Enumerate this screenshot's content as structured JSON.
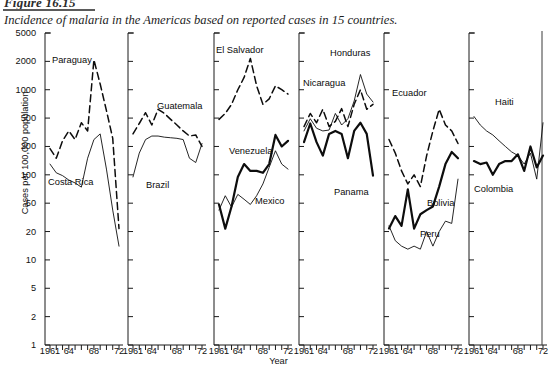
{
  "figure": {
    "number": "Figure 16.15",
    "caption": "Incidence of malaria in the Americas based on reported cases in 15 countries."
  },
  "axes": {
    "ylabel": "Cases per 100,000 population",
    "xlabel": "Year",
    "yticks": [
      "1",
      "2",
      "5",
      "10",
      "20",
      "50",
      "100",
      "200",
      "500",
      "1000",
      "2000",
      "5000"
    ],
    "xticks": [
      "1961",
      "64",
      "68",
      "72"
    ]
  },
  "labels": {
    "paraguay": "Paraguay",
    "costa_rica": "Costa Rica",
    "guatemala": "Guatemala",
    "brazil": "Brazil",
    "el_salvador": "El Salvador",
    "venezuela": "Venezuela",
    "mexico": "Mexico",
    "honduras": "Honduras",
    "nicaragua": "Nicaragua",
    "panama": "Panama",
    "ecuador": "Ecuador",
    "bolivia": "Bolivia",
    "peru": "Peru",
    "haiti": "Haiti",
    "colombia": "Colombia"
  },
  "chart_data": {
    "type": "line",
    "title": "Incidence of malaria in the Americas based on reported cases in 15 countries.",
    "xlabel": "Year",
    "ylabel": "Cases per 100,000 population",
    "yscale": "log",
    "ylim": [
      1,
      5000
    ],
    "ytick_values": [
      1,
      2,
      5,
      10,
      20,
      50,
      100,
      200,
      500,
      1000,
      2000,
      5000
    ],
    "x": [
      1961,
      1962,
      1963,
      1964,
      1965,
      1966,
      1967,
      1968,
      1969,
      1970,
      1971,
      1972
    ],
    "xlim": [
      1961,
      1972
    ],
    "grid": false,
    "legend": "inline-annotations",
    "panels": [
      {
        "panel": 1,
        "series": [
          {
            "name": "Paraguay",
            "style": "dashed",
            "width": "medium",
            "values": [
              190,
              150,
              240,
              330,
              250,
              430,
              330,
              2100,
              1150,
              600,
              260,
              22
            ]
          },
          {
            "name": "Costa Rica",
            "style": "solid",
            "width": "thin",
            "values": [
              130,
              105,
              98,
              88,
              82,
              74,
              150,
              250,
              300,
              115,
              40,
              14
            ]
          }
        ]
      },
      {
        "panel": 2,
        "series": [
          {
            "name": "Guatemala",
            "style": "dashed",
            "width": "medium",
            "values": [
              300,
              420,
              570,
              400,
              620,
              560,
              480,
              400,
              330,
              280,
              290,
              200
            ]
          },
          {
            "name": "Brazil",
            "style": "solid",
            "width": "thin",
            "values": [
              95,
              170,
              250,
              280,
              280,
              270,
              265,
              260,
              250,
              150,
              135,
              220
            ]
          }
        ]
      },
      {
        "panel": 3,
        "series": [
          {
            "name": "El Salvador",
            "style": "dashed",
            "width": "medium",
            "values": [
              480,
              560,
              700,
              1000,
              1350,
              2200,
              1100,
              700,
              800,
              1100,
              1000,
              900
            ]
          },
          {
            "name": "Venezuela",
            "style": "solid",
            "width": "thick",
            "values": [
              48,
              22,
              45,
              95,
              130,
              110,
              110,
              105,
              130,
              290,
              200,
              240
            ]
          },
          {
            "name": "Mexico",
            "style": "solid",
            "width": "thin",
            "values": [
              40,
              60,
              44,
              62,
              55,
              48,
              60,
              80,
              120,
              180,
              130,
              115
            ]
          }
        ]
      },
      {
        "panel": 4,
        "series": [
          {
            "name": "Honduras",
            "style": "solid",
            "width": "thin",
            "values": [
              330,
              490,
              360,
              330,
              340,
              560,
              400,
              490,
              760,
              1450,
              900,
              740
            ]
          },
          {
            "name": "Nicaragua",
            "style": "dashed",
            "width": "medium",
            "values": [
              380,
              560,
              430,
              620,
              380,
              450,
              630,
              380,
              700,
              1000,
              620,
              700
            ]
          },
          {
            "name": "Panama",
            "style": "solid",
            "width": "thick",
            "values": [
              230,
              420,
              230,
              160,
              300,
              330,
              300,
              150,
              330,
              430,
              300,
              98
            ]
          }
        ]
      },
      {
        "panel": 5,
        "series": [
          {
            "name": "Ecuador",
            "style": "dashed",
            "width": "medium",
            "values": [
              250,
              170,
              110,
              80,
              100,
              75,
              160,
              330,
              620,
              400,
              330,
              220
            ]
          },
          {
            "name": "Bolivia",
            "style": "solid",
            "width": "thick",
            "values": [
              22,
              33,
              24,
              70,
              22,
              35,
              40,
              45,
              75,
              130,
              175,
              150
            ]
          },
          {
            "name": "Peru",
            "style": "solid",
            "width": "thin",
            "values": [
              24,
              16,
              14,
              13,
              14,
              13,
              20,
              14,
              20,
              28,
              26,
              90
            ]
          }
        ]
      },
      {
        "panel": 6,
        "series": [
          {
            "name": "Haiti",
            "style": "solid",
            "width": "thin",
            "values": [
              520,
              400,
              330,
              290,
              240,
              200,
              175,
              160,
              130,
              170,
              90,
              430
            ]
          },
          {
            "name": "Colombia",
            "style": "solid",
            "width": "thick",
            "values": [
              140,
              130,
              135,
              100,
              130,
              140,
              140,
              165,
              110,
              200,
              120,
              160
            ]
          }
        ]
      }
    ]
  }
}
